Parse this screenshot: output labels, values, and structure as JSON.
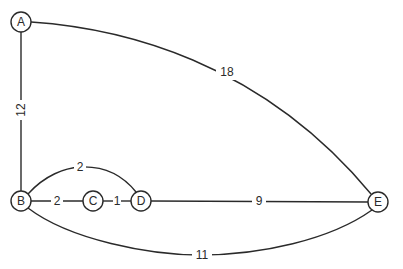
{
  "diagram": {
    "type": "weighted-undirected-graph",
    "colors": {
      "stroke": "#2a2a2a",
      "background": "#ffffff"
    },
    "nodes": [
      {
        "id": "A",
        "label": "A",
        "x": 21,
        "y": 22
      },
      {
        "id": "B",
        "label": "B",
        "x": 21,
        "y": 201
      },
      {
        "id": "C",
        "label": "C",
        "x": 93,
        "y": 201
      },
      {
        "id": "D",
        "label": "D",
        "x": 141,
        "y": 201
      },
      {
        "id": "E",
        "label": "E",
        "x": 378,
        "y": 202
      }
    ],
    "edges": [
      {
        "from": "A",
        "to": "E",
        "weight": "18"
      },
      {
        "from": "A",
        "to": "B",
        "weight": "12"
      },
      {
        "from": "B",
        "to": "D",
        "weight": "2",
        "route": "arc-above"
      },
      {
        "from": "B",
        "to": "C",
        "weight": "2"
      },
      {
        "from": "C",
        "to": "D",
        "weight": "1"
      },
      {
        "from": "D",
        "to": "E",
        "weight": "9"
      },
      {
        "from": "B",
        "to": "E",
        "weight": "11",
        "route": "arc-below"
      }
    ]
  }
}
